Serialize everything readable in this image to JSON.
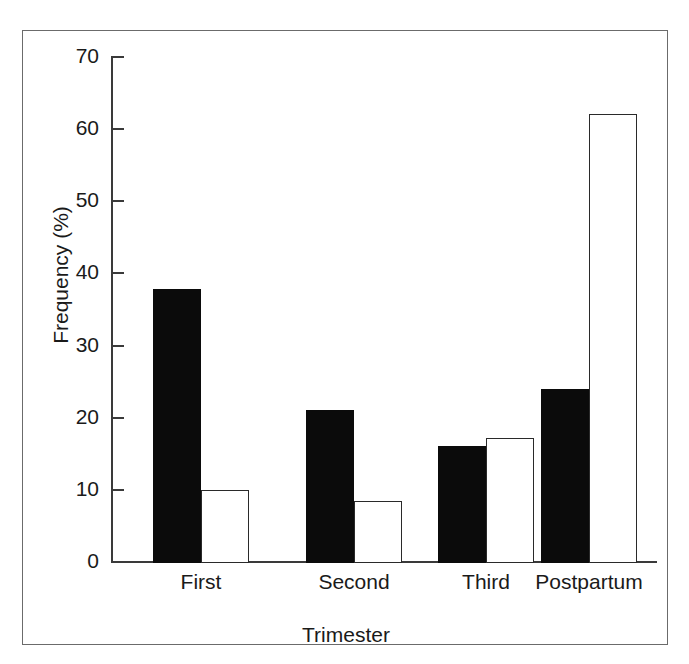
{
  "figure": {
    "background": "#ffffff",
    "frame_color": "#6b6b6b"
  },
  "chart_data": {
    "type": "bar",
    "title": "",
    "xlabel": "Trimester",
    "ylabel": "Frequency (%)",
    "categories": [
      "First",
      "Second",
      "Third",
      "Postpartum"
    ],
    "yticks": [
      0,
      10,
      20,
      30,
      40,
      50,
      60,
      70
    ],
    "ylim": [
      0,
      70
    ],
    "grid": false,
    "legend": "none",
    "series": [
      {
        "name": "filled",
        "style": "solid-black",
        "color": "#0b0b0b",
        "values": [
          38.0,
          21.2,
          16.2,
          24.1
        ]
      },
      {
        "name": "open",
        "style": "open-white",
        "color": "#ffffff",
        "edge_color": "#2a2a2a",
        "values": [
          10.1,
          8.6,
          17.3,
          62.2
        ]
      }
    ]
  }
}
